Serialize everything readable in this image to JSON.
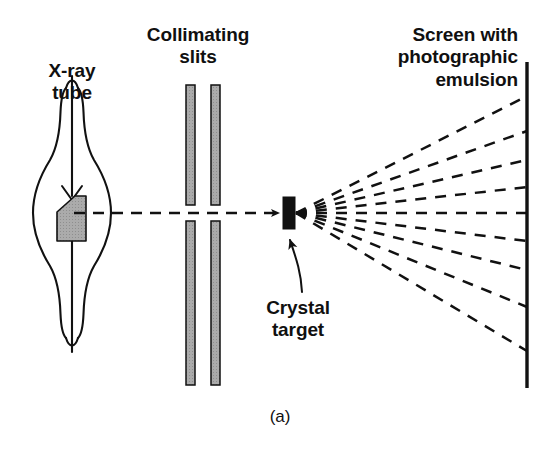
{
  "figure": {
    "panel_label": "(a)",
    "background_color": "#ffffff",
    "ink_color": "#111111",
    "slit_fill_color": "#a8a8a8",
    "anode_fill_color": "#a9a9a9",
    "crystal_fill_color": "#111111",
    "width": 558,
    "height": 464
  },
  "labels": {
    "xray_tube": "X-ray\ntube",
    "collimating_slits": "Collimating\nslits",
    "screen_emulsion": "Screen with\nphotographic\nemulsion",
    "crystal_target": "Crystal\ntarget"
  },
  "components": {
    "xray_tube": {
      "name": "x-ray-tube",
      "bulb_center_x": 72,
      "bulb_center_y": 213,
      "bulb_radius": 40,
      "stem_top_y": 76,
      "stem_bottom_y": 352,
      "neck_half_width": 7
    },
    "anode": {
      "name": "anode-target",
      "x": 57,
      "y": 198,
      "width": 29,
      "height": 43
    },
    "cathode_filament": {
      "name": "cathode-filament",
      "apex_y": 196,
      "tip_y": 212
    },
    "collimating_slits": {
      "name": "collimating-slits",
      "bar_width": 9,
      "bars_x": [
        186,
        211
      ],
      "upper_top_y": 85,
      "upper_bottom_y": 205,
      "lower_top_y": 221,
      "lower_bottom_y": 385
    },
    "crystal_target": {
      "name": "crystal-target",
      "x": 283,
      "y": 197,
      "width": 12,
      "height": 32
    },
    "screen": {
      "name": "photographic-screen",
      "x": 527,
      "top_y": 62,
      "bottom_y": 388
    },
    "incident_beam": {
      "name": "incident-beam",
      "from_x": 72,
      "to_x": 281,
      "y": 213,
      "style": "dashed-with-arrowhead"
    }
  },
  "diffracted_rays": {
    "origin_x": 296,
    "origin_y": 213,
    "count": 9,
    "style": "dashed",
    "screen_x": 527,
    "screen_end_y": [
      96,
      131,
      160,
      187,
      213,
      241,
      270,
      307,
      351
    ]
  },
  "pointer_arrow": {
    "name": "crystal-pointer-arrow",
    "tip_x": 289,
    "tip_y": 234,
    "tail_x": 300,
    "tail_y": 292
  }
}
